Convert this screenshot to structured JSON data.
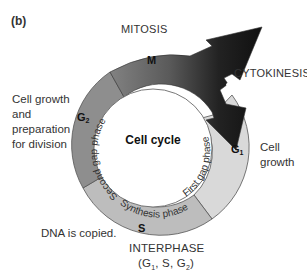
{
  "figure": {
    "panel_label": "(b)",
    "center_title": "Cell cycle",
    "phases": [
      {
        "id": "M",
        "label": "M",
        "name": "MITOSIS",
        "color_start": "#8c8c8c",
        "color_end": "#1a1a1a"
      },
      {
        "id": "G1",
        "label": "G",
        "subscript": "1",
        "inner_text": "First gap phase",
        "color": "#d9d9d9"
      },
      {
        "id": "S",
        "label": "S",
        "inner_text": "Synthesis phase",
        "color": "#bdbdbd"
      },
      {
        "id": "G2",
        "label": "G",
        "subscript": "2",
        "inner_text": "Second gap phase",
        "color": "#8e8e8e"
      }
    ],
    "annotations": {
      "mitosis": "MITOSIS",
      "cytokinesis": "CYTOKINESIS",
      "g2_desc": [
        "Cell growth",
        "and",
        "preparation",
        "for division"
      ],
      "g1_desc": [
        "Cell",
        "growth"
      ],
      "s_desc": "DNA is copied.",
      "interphase": "INTERPHASE",
      "interphase_sub": {
        "open": "(G",
        "s1": "1",
        "mid": ", S, G",
        "s2": "2",
        "close": ")"
      }
    }
  }
}
